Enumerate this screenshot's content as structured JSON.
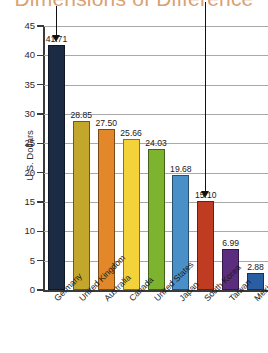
{
  "title": "Dimensions of Difference",
  "title_color": "#d9a273",
  "chart_data": {
    "type": "bar",
    "title": "Dimensions of Difference",
    "xlabel": "",
    "ylabel": "U.S. Dollars",
    "ylim": [
      0,
      45
    ],
    "yticks": [
      0,
      5,
      10,
      15,
      20,
      25,
      30,
      35,
      40,
      45
    ],
    "grid": true,
    "legend": "none",
    "categories": [
      "Germany",
      "United Kingdom",
      "Australia",
      "Canada",
      "United States",
      "Japan",
      "South Korea",
      "Taiwan",
      "Mexico"
    ],
    "values": [
      41.71,
      28.85,
      27.5,
      25.66,
      24.03,
      19.68,
      15.1,
      6.99,
      2.88
    ],
    "value_labels": [
      "41.71",
      "28.85",
      "27.50",
      "25.66",
      "24.03",
      "19.68",
      "15.10",
      "6.99",
      "2.88"
    ],
    "colors": [
      "#1b2b44",
      "#c2a72c",
      "#e2882a",
      "#f4d23a",
      "#7db32e",
      "#4a90c8",
      "#bf3b22",
      "#5b2d7e",
      "#2a5ea2"
    ],
    "annotations": [
      {
        "name": "arrow-germany",
        "target_category": "Germany",
        "target_value": 41.71
      },
      {
        "name": "arrow-south-korea",
        "target_category": "South Korea",
        "target_value": 15.1
      }
    ]
  }
}
